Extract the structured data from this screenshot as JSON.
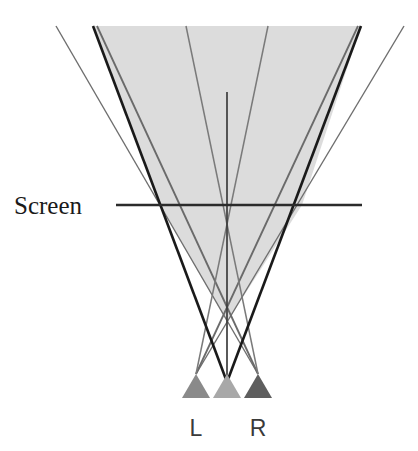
{
  "figure": {
    "title_text": "",
    "background_color": "#ffffff",
    "labels": {
      "screen": "Screen",
      "left_projector": "L",
      "right_projector": "R"
    },
    "colors": {
      "shaded_region": "#dcdcdc",
      "thick_beam": "#1a1a1a",
      "thin_beam": "#6e6e6e",
      "screen_line": "#2b2b2b",
      "center_axis": "#3d3d3d",
      "projector_left": "#8a8a8a",
      "projector_center": "#a8a8a8",
      "projector_right": "#5e5e5e",
      "text": "#1a1a1a"
    },
    "geometry": {
      "screen_line_y": 205,
      "screen_line_x_start": 116,
      "screen_line_x_end": 362,
      "screen_intersection_left_x": 160,
      "screen_intersection_right_x": 302,
      "shaded_apex_x": 227,
      "shaded_apex_y": 322,
      "beam_convergence_x": 227,
      "beam_convergence_y": 382,
      "projector_left_x": 196,
      "projector_center_x": 227,
      "projector_right_x": 258,
      "projector_base_y": 398,
      "projector_apex_y": 374,
      "projector_half_width": 14,
      "top_y": 26
    }
  }
}
